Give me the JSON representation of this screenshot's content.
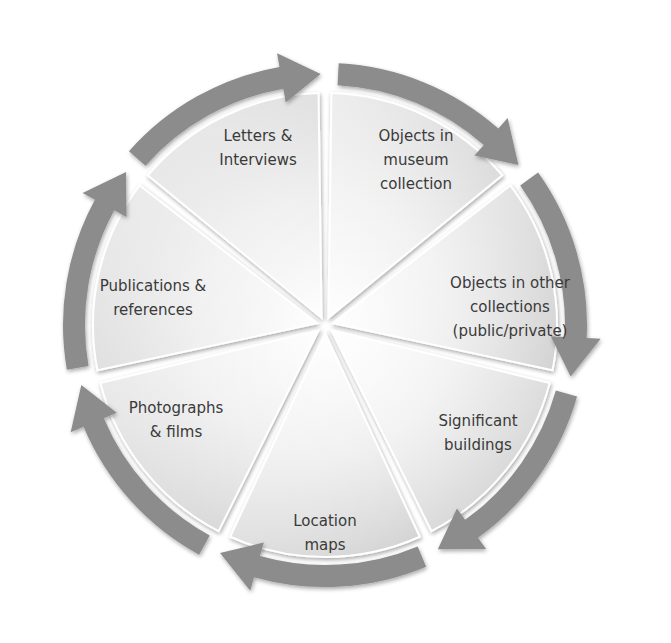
{
  "diagram": {
    "type": "cycle",
    "center": [
      325,
      325
    ],
    "colors": {
      "arrow": "#8c8c8c",
      "wedge_light": "#f7f7f7",
      "wedge_dark": "#bdbdbd",
      "text": "#3a3a3a",
      "background": "#ffffff"
    },
    "segments": [
      {
        "id": "letters",
        "lines": [
          "Letters &",
          "Interviews"
        ],
        "label_pos": [
          258,
          148
        ]
      },
      {
        "id": "museum",
        "lines": [
          "Objects in",
          "museum",
          "collection"
        ],
        "label_pos": [
          416,
          160
        ]
      },
      {
        "id": "other",
        "lines": [
          "Objects in other",
          "collections",
          "(public/private)"
        ],
        "label_pos": [
          510,
          307
        ]
      },
      {
        "id": "buildings",
        "lines": [
          "Significant",
          "buildings"
        ],
        "label_pos": [
          478,
          433
        ]
      },
      {
        "id": "location",
        "lines": [
          "Location",
          "maps"
        ],
        "label_pos": [
          325,
          533
        ]
      },
      {
        "id": "photographs",
        "lines": [
          "Photographs",
          "& films"
        ],
        "label_pos": [
          176,
          420
        ]
      },
      {
        "id": "publications",
        "lines": [
          "Publications &",
          "references"
        ],
        "label_pos": [
          153,
          298
        ]
      }
    ],
    "flow_direction": "clockwise"
  }
}
